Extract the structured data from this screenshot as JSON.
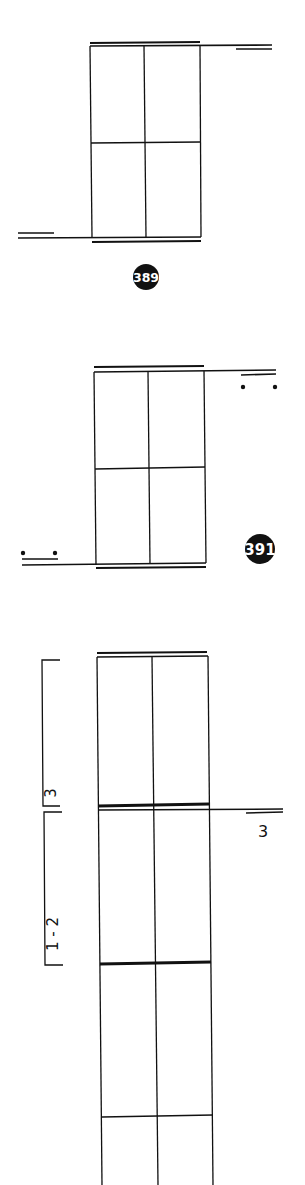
{
  "figure": {
    "type": "rotated-music-notation",
    "systems": [
      {
        "id": "system-1",
        "badge": "389",
        "grid_columns": 2,
        "grid_rows": 2,
        "endings": []
      },
      {
        "id": "system-2",
        "badge": "391",
        "grid_columns": 2,
        "grid_rows": 2,
        "repeat_dots": true
      },
      {
        "id": "system-3",
        "grid_columns": 2,
        "brackets": [
          {
            "label": "3"
          },
          {
            "label": "1 - 2"
          }
        ],
        "side_label": "3"
      }
    ]
  },
  "colors": {
    "ink": "#111111",
    "background": "#ffffff",
    "badge_fill": "#111111",
    "badge_text": "#ffffff"
  }
}
